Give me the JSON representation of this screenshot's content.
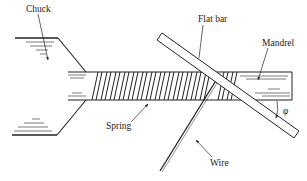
{
  "diagram": {
    "type": "mechanical-setup",
    "colors": {
      "line": "#222222",
      "background": "#ffffff"
    },
    "labels": {
      "chuck": "Chuck",
      "flat_bar": "Flat bar",
      "mandrel": "Mandrel",
      "spring": "Spring",
      "wire": "Wire",
      "angle": "φ"
    },
    "components": [
      {
        "id": "chuck",
        "label": "Chuck"
      },
      {
        "id": "mandrel",
        "label": "Mandrel"
      },
      {
        "id": "spring",
        "label": "Spring"
      },
      {
        "id": "flat-bar",
        "label": "Flat bar"
      },
      {
        "id": "wire",
        "label": "Wire"
      },
      {
        "id": "angle",
        "label": "φ"
      }
    ]
  }
}
